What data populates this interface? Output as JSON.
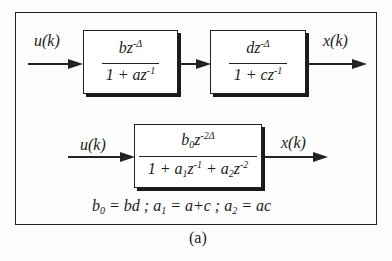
{
  "figure": {
    "caption": "(a)",
    "top_row": {
      "input_label": "u(k)",
      "output_label": "x(k)",
      "block1": {
        "num_base": "bz",
        "num_exp": "-Δ",
        "den_pre": "1 + az",
        "den_exp": "-1"
      },
      "block2": {
        "num_base": "dz",
        "num_exp": "-Δ",
        "den_pre": "1 + cz",
        "den_exp": "-1"
      }
    },
    "bottom_row": {
      "input_label": "u(k)",
      "output_label": "x(k)",
      "block": {
        "num_b": "b",
        "num_b_sub": "0",
        "num_z": "z",
        "num_exp": "-2Δ",
        "den_1": "1 + a",
        "den_1_sub": "1",
        "den_z1": "z",
        "den_z1_exp": "-1",
        "den_2": " + a",
        "den_2_sub": "2",
        "den_z2": "z",
        "den_z2_exp": "-2"
      }
    },
    "equation": {
      "b0": "b",
      "b0_sub": "0",
      "b0_rhs": " = bd ; a",
      "a1_sub": "1",
      "a1_rhs": " = a+c ; a",
      "a2_sub": "2",
      "a2_rhs": " = ac"
    }
  }
}
